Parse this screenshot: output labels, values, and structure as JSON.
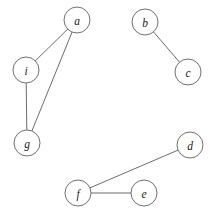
{
  "diagram": {
    "type": "node-link-graph",
    "background_color": "#ffffff",
    "node_fill_color": "#ffffff",
    "node_stroke_color": "#606060",
    "edge_color": "#5a5a5a",
    "label_color": "#1a1a1a",
    "node_radius": 13,
    "canvas": {
      "width": 215,
      "height": 217
    }
  },
  "chart_data": {
    "type": "diagram",
    "title": "",
    "nodes": [
      {
        "id": "a",
        "label": "a",
        "x": 77,
        "y": 20
      },
      {
        "id": "b",
        "label": "b",
        "x": 145,
        "y": 22
      },
      {
        "id": "c",
        "label": "c",
        "x": 188,
        "y": 72
      },
      {
        "id": "d",
        "label": "d",
        "x": 190,
        "y": 145
      },
      {
        "id": "e",
        "label": "e",
        "x": 144,
        "y": 193
      },
      {
        "id": "f",
        "label": "f",
        "x": 78,
        "y": 193
      },
      {
        "id": "g",
        "label": "g",
        "x": 27,
        "y": 143
      },
      {
        "id": "i",
        "label": "i",
        "x": 26,
        "y": 70
      }
    ],
    "edges": [
      {
        "source": "a",
        "target": "i"
      },
      {
        "source": "a",
        "target": "g"
      },
      {
        "source": "i",
        "target": "g"
      },
      {
        "source": "b",
        "target": "c"
      },
      {
        "source": "d",
        "target": "f"
      },
      {
        "source": "e",
        "target": "f"
      }
    ],
    "node_count": 8,
    "edge_count": 6,
    "components": [
      [
        "a",
        "i",
        "g"
      ],
      [
        "b",
        "c"
      ],
      [
        "d",
        "f",
        "e"
      ]
    ],
    "labels": {
      "a": "a",
      "b": "b",
      "c": "c",
      "d": "d",
      "e": "e",
      "f": "f",
      "g": "g",
      "i": "i"
    }
  }
}
